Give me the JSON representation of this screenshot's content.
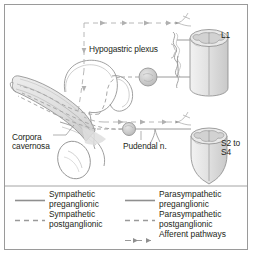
{
  "figure": {
    "border_color": "#9a9a9a",
    "line_color": "#8d8d8d",
    "text_color": "#231f20"
  },
  "diagram": {
    "labels": [
      {
        "id": "hypogastric-plexus",
        "text": "Hypogastric plexus"
      },
      {
        "id": "corpora-cavernosa",
        "text": "Corpora\ncavernosa"
      },
      {
        "id": "pudendal-nerve",
        "text": "Pudendal n."
      },
      {
        "id": "spinal-level-l1",
        "text": "L1"
      },
      {
        "id": "spinal-level-s2-s4",
        "text": "S2 to\nS4"
      }
    ],
    "structures": [
      {
        "id": "spinal-cord-l1",
        "name": "L1 spinal cord segment"
      },
      {
        "id": "spinal-cord-s2s4",
        "name": "S2 to S4 spinal cord segment (conus medullaris)"
      },
      {
        "id": "sympathetic-chain",
        "name": "sympathetic trunk"
      },
      {
        "id": "hypogastric-ganglion",
        "name": "hypogastric plexus ganglion"
      },
      {
        "id": "pelvic-ganglion",
        "name": "pelvic ganglion"
      },
      {
        "id": "bladder",
        "name": "urinary bladder"
      },
      {
        "id": "prostate",
        "name": "prostate"
      },
      {
        "id": "penis",
        "name": "penis with corpora cavernosa"
      },
      {
        "id": "testis",
        "name": "testis"
      }
    ]
  },
  "legend": {
    "entries": [
      {
        "id": "sympathetic-preganglionic",
        "label": "Sympathetic\npreganglionic",
        "style": "solid",
        "column": "left"
      },
      {
        "id": "sympathetic-postganglionic",
        "label": "Sympathetic\npostganglionic",
        "style": "dashed",
        "column": "left"
      },
      {
        "id": "parasympathetic-preganglionic",
        "label": "Parasympathetic\npreganglionic",
        "style": "solid",
        "column": "right"
      },
      {
        "id": "parasympathetic-postganglionic",
        "label": "Parasympathetic\npostganglionic",
        "style": "dashed",
        "column": "right"
      },
      {
        "id": "afferent-pathways",
        "label": "Afferent pathways",
        "style": "arrow",
        "column": "right"
      }
    ]
  }
}
